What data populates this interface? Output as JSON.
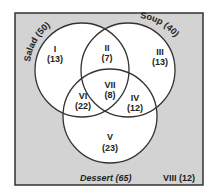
{
  "diagram": {
    "type": "venn",
    "sets": [
      {
        "name": "Salad",
        "total_label": "(50)",
        "display": "Salad (50)"
      },
      {
        "name": "Soup",
        "total_label": "(40)",
        "display": "Soup (40)"
      },
      {
        "name": "Dessert",
        "total_label": "(65)",
        "display": "Dessert (65)"
      }
    ],
    "regions": [
      {
        "id": "I",
        "count": "(13)"
      },
      {
        "id": "II",
        "count": "(7)"
      },
      {
        "id": "III",
        "count": "(13)"
      },
      {
        "id": "IV",
        "count": "(12)"
      },
      {
        "id": "V",
        "count": "(23)"
      },
      {
        "id": "VI",
        "count": "(22)"
      },
      {
        "id": "VII",
        "count": "(8)"
      }
    ],
    "outside": {
      "id": "VIII",
      "count": "(12)",
      "display": "VIII (12)"
    },
    "colors": {
      "background": "#d3d3d3",
      "circle_fill": "#ffffff",
      "stroke": "#333333"
    }
  }
}
